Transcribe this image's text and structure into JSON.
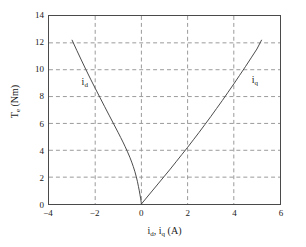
{
  "chart_data": {
    "type": "line",
    "title": "",
    "xlabel": "i_d, i_q (A)",
    "ylabel": "T_e (Nm)",
    "xlim": [
      -4,
      6
    ],
    "ylim": [
      0,
      14
    ],
    "xticks": [
      -4,
      -2,
      0,
      2,
      4,
      6
    ],
    "yticks": [
      0,
      2,
      4,
      6,
      8,
      10,
      12,
      14
    ],
    "xtick_labels": [
      "−4",
      "−2",
      "0",
      "2",
      "4",
      "6"
    ],
    "ytick_labels": [
      "0",
      "2",
      "4",
      "6",
      "8",
      "10",
      "12",
      "14"
    ],
    "grid": true,
    "grid_style": "dashed",
    "grid_color": "#9a9a9a",
    "line_color": "#4a4a4a",
    "frame_color": "#4a4a4a",
    "legend": "none",
    "annotations": [
      {
        "text": "i_d",
        "x": -2.6,
        "y": 9.1
      },
      {
        "text": "i_q",
        "x": 4.7,
        "y": 9.2
      }
    ],
    "series": [
      {
        "name": "i_d",
        "label": "i_d",
        "points": [
          [
            -3.0,
            12.2
          ],
          [
            -2.8,
            11.45
          ],
          [
            -2.6,
            10.72
          ],
          [
            -2.4,
            10.0
          ],
          [
            -2.2,
            9.3
          ],
          [
            -2.0,
            8.62
          ],
          [
            -1.8,
            7.95
          ],
          [
            -1.6,
            7.28
          ],
          [
            -1.4,
            6.62
          ],
          [
            -1.2,
            5.96
          ],
          [
            -1.0,
            5.3
          ],
          [
            -0.9,
            4.96
          ],
          [
            -0.8,
            4.62
          ],
          [
            -0.7,
            4.26
          ],
          [
            -0.6,
            3.88
          ],
          [
            -0.5,
            3.48
          ],
          [
            -0.42,
            3.12
          ],
          [
            -0.35,
            2.78
          ],
          [
            -0.28,
            2.4
          ],
          [
            -0.22,
            2.02
          ],
          [
            -0.17,
            1.66
          ],
          [
            -0.13,
            1.32
          ],
          [
            -0.09,
            0.98
          ],
          [
            -0.06,
            0.68
          ],
          [
            -0.03,
            0.38
          ],
          [
            -0.01,
            0.14
          ],
          [
            0.0,
            0.0
          ]
        ]
      },
      {
        "name": "i_q",
        "label": "i_q",
        "points": [
          [
            0.0,
            0.0
          ],
          [
            0.25,
            0.52
          ],
          [
            0.5,
            1.04
          ],
          [
            0.75,
            1.56
          ],
          [
            1.0,
            2.08
          ],
          [
            1.25,
            2.6
          ],
          [
            1.5,
            3.14
          ],
          [
            1.75,
            3.68
          ],
          [
            2.0,
            4.22
          ],
          [
            2.25,
            4.78
          ],
          [
            2.5,
            5.34
          ],
          [
            2.75,
            5.92
          ],
          [
            3.0,
            6.5
          ],
          [
            3.25,
            7.1
          ],
          [
            3.5,
            7.7
          ],
          [
            3.75,
            8.32
          ],
          [
            4.0,
            8.94
          ],
          [
            4.25,
            9.58
          ],
          [
            4.5,
            10.22
          ],
          [
            4.75,
            10.88
          ],
          [
            5.0,
            11.54
          ],
          [
            5.2,
            12.2
          ]
        ]
      }
    ]
  },
  "axis": {
    "xlabel_parts": {
      "pre": "i",
      "sub1": "d",
      "mid": ", i",
      "sub2": "q",
      "post": " (A)"
    },
    "ylabel_parts": {
      "pre": "T",
      "sub1": "e",
      "post": " (Nm)"
    }
  }
}
